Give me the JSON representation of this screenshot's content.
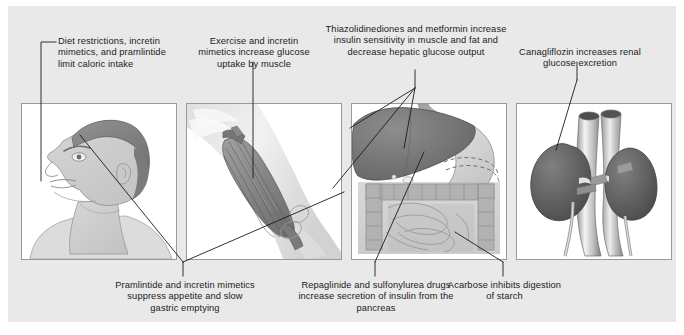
{
  "figure": {
    "background_color": "#e9e9e9",
    "panel_background": "#ffffff",
    "line_color": "#1b1b1b"
  },
  "callouts": [
    {
      "id": "diet-restrictions",
      "text": "Diet restrictions, incretin mimetics, and pramlintide limit caloric intake",
      "position": "top-left",
      "target_organ": "head",
      "drugs": [
        "diet restrictions",
        "incretin mimetics",
        "pramlintide"
      ],
      "effect": "limit caloric intake"
    },
    {
      "id": "exercise-muscle-uptake",
      "text": "Exercise and incretin mimetics increase glucose uptake by muscle",
      "position": "top-center-left",
      "target_organ": "muscle",
      "drugs": [
        "exercise",
        "incretin mimetics"
      ],
      "effect": "increase glucose uptake by muscle"
    },
    {
      "id": "tzd-metformin",
      "text": "Thiazolidinediones and metformin increase insulin sensitivity in muscle and fat and decrease hepatic glucose output",
      "position": "top-center-right",
      "target_organ": "liver-and-muscle",
      "drugs": [
        "thiazolidinediones",
        "metformin"
      ],
      "effect": "increase insulin sensitivity in muscle and fat and decrease hepatic glucose output"
    },
    {
      "id": "canagliflozin-kidney",
      "text": "Canagliflozin increases renal glucose excretion",
      "position": "top-right",
      "target_organ": "kidney",
      "drugs": [
        "canagliflozin"
      ],
      "effect": "increases renal glucose excretion"
    },
    {
      "id": "pramlintide-appetite",
      "text": "Pramlintide and incretin mimetics suppress appetite and slow gastric emptying",
      "position": "bottom-left",
      "target_organ": "head-and-muscle",
      "drugs": [
        "pramlintide",
        "incretin mimetics"
      ],
      "effect": "suppress appetite and slow gastric emptying"
    },
    {
      "id": "repaglinide-sulfonylurea",
      "text": "Repaglinide and sulfonylurea drugs increase secretion of insulin from the pancreas",
      "position": "bottom-center",
      "target_organ": "pancreas",
      "drugs": [
        "repaglinide",
        "sulfonylurea drugs"
      ],
      "effect": "increase secretion of insulin from the pancreas"
    },
    {
      "id": "acarbose-starch",
      "text": "Acarbose inhibits digestion of starch",
      "position": "bottom-right",
      "target_organ": "intestine",
      "drugs": [
        "acarbose"
      ],
      "effect": "inhibits digestion of starch"
    }
  ],
  "panels": [
    {
      "id": "panel-head",
      "organ": "head",
      "label": "head in profile, facing left"
    },
    {
      "id": "panel-muscle",
      "organ": "muscle",
      "label": "upper arm biceps muscle"
    },
    {
      "id": "panel-viscera",
      "organ": "liver-stomach-pancreas-intestine",
      "label": "liver, stomach, pancreas and intestines"
    },
    {
      "id": "panel-kidney",
      "organ": "kidney",
      "label": "kidneys with aorta and vena cava"
    }
  ]
}
